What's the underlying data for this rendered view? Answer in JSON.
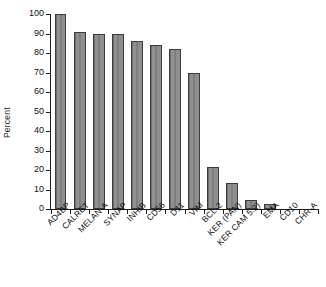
{
  "chart_data": {
    "type": "bar",
    "title": "",
    "subtitle": "",
    "xlabel": "",
    "ylabel": "Percent",
    "ylim": [
      0,
      100
    ],
    "yticks": [
      0,
      10,
      20,
      30,
      40,
      50,
      60,
      70,
      80,
      90,
      100
    ],
    "ytick_labels": [
      "0",
      "10",
      "20",
      "30",
      "40",
      "50",
      "60",
      "70",
      "80",
      "90",
      "100"
    ],
    "grid": false,
    "legend": null,
    "legend_position": "none",
    "bar_color": "#8a8a8a",
    "bar_edge_color": "#3d3d3d",
    "axis_color": "#1f1f1f",
    "categories": [
      "AD4BP",
      "CALRET",
      "MELAN-A",
      "SYNAP",
      "INHIB",
      "CD56",
      "D11",
      "VIM",
      "BCL-2",
      "KER (PAN)",
      "KER CAM 5.2)",
      "EMA",
      "CD10",
      "CHR-A"
    ],
    "values": [
      100,
      91,
      90,
      90,
      86,
      84,
      82,
      70,
      21.5,
      13.5,
      4.5,
      2.5,
      0,
      0
    ]
  }
}
